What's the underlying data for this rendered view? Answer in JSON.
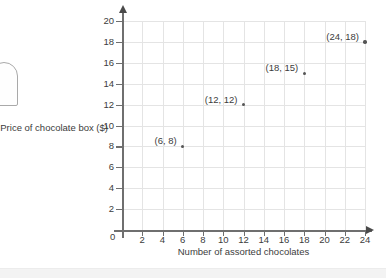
{
  "chart_data": {
    "type": "scatter",
    "title": "",
    "xlabel": "Number of assorted chocolates",
    "ylabel": "Price of chocolate box ($)",
    "xlim": [
      0,
      24
    ],
    "ylim": [
      0,
      20
    ],
    "xticks": [
      2,
      4,
      6,
      8,
      10,
      12,
      14,
      16,
      18,
      20,
      22,
      24
    ],
    "yticks": [
      2,
      4,
      6,
      8,
      10,
      12,
      14,
      16,
      18,
      20
    ],
    "origin_label": "0",
    "grid": true,
    "legend": "none",
    "x": [
      6,
      12,
      18,
      24
    ],
    "y": [
      8,
      12,
      15,
      18
    ],
    "point_labels": [
      "(6, 8)",
      "(12, 12)",
      "(18, 15)",
      "(24, 18)"
    ],
    "points": [
      {
        "x": 6,
        "y": 8,
        "label": "(6, 8)"
      },
      {
        "x": 12,
        "y": 12,
        "label": "(12, 12)"
      },
      {
        "x": 18,
        "y": 15,
        "label": "(18, 15)"
      },
      {
        "x": 24,
        "y": 18,
        "label": "(24, 18)"
      }
    ],
    "colors": {
      "point": "#555555",
      "grid": "#e4e4e4",
      "axis": "#6f6f6f",
      "text": "#3c3c3c"
    }
  }
}
